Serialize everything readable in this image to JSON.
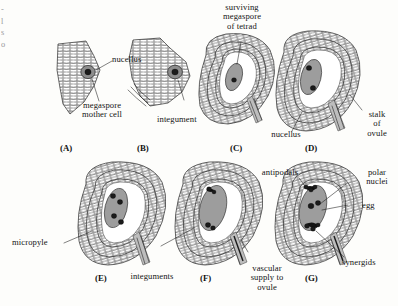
{
  "figure": {
    "panel_count": 7
  },
  "edge_fragment": "-\nl\ns\no",
  "panels": [
    {
      "id": "A",
      "letter": "(A)"
    },
    {
      "id": "B",
      "letter": "(B)"
    },
    {
      "id": "C",
      "letter": "(C)"
    },
    {
      "id": "D",
      "letter": "(D)"
    },
    {
      "id": "E",
      "letter": "(E)"
    },
    {
      "id": "F",
      "letter": "(F)"
    },
    {
      "id": "G",
      "letter": "(G)"
    }
  ],
  "labels": {
    "nucellus_a": "nucellus",
    "megaspore_mother_cell": "megaspore\nmother cell",
    "integument": "integument",
    "surviving_megaspore": "surviving\nmegaspore\nof tetrad",
    "nucellus_d": "nucellus",
    "stalk_of_ovule": "stalk\nof\novule",
    "micropyle": "micropyle",
    "integuments": "integuments",
    "vascular_supply": "vascular\nsupply to\novule",
    "antipodals": "antipodals",
    "polar_nuclei": "polar\nnuclei",
    "egg": "egg",
    "synergids": "synergids"
  },
  "colors": {
    "ink": "#1a1a1a",
    "cell_stroke": "#2b2b2b",
    "cell_fill": "#ffffff",
    "embryo_sac_fill": "#9d9d9d",
    "megaspore_fill": "#8a8a8a",
    "nucleus_fill": "#1b1b1b",
    "vascular_fill": "#b9b9b9",
    "paper": "#fdfdfb"
  }
}
